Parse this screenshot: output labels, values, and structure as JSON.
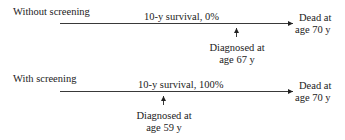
{
  "panels": [
    {
      "label": "Without screening",
      "survival": "10-y survival, 0%",
      "diagnosed_line1": "Diagnosed at",
      "diagnosed_line2": "age 67 y",
      "dead_line1": "Dead at",
      "dead_line2": "age 70 y"
    },
    {
      "label": "With screening",
      "survival": "10-y survival, 100%",
      "diagnosed_line1": "Diagnosed at",
      "diagnosed_line2": "age 59 y",
      "dead_line1": "Dead at",
      "dead_line2": "age 70 y"
    }
  ],
  "colors": {
    "line": "#222222",
    "text": "#222222"
  }
}
